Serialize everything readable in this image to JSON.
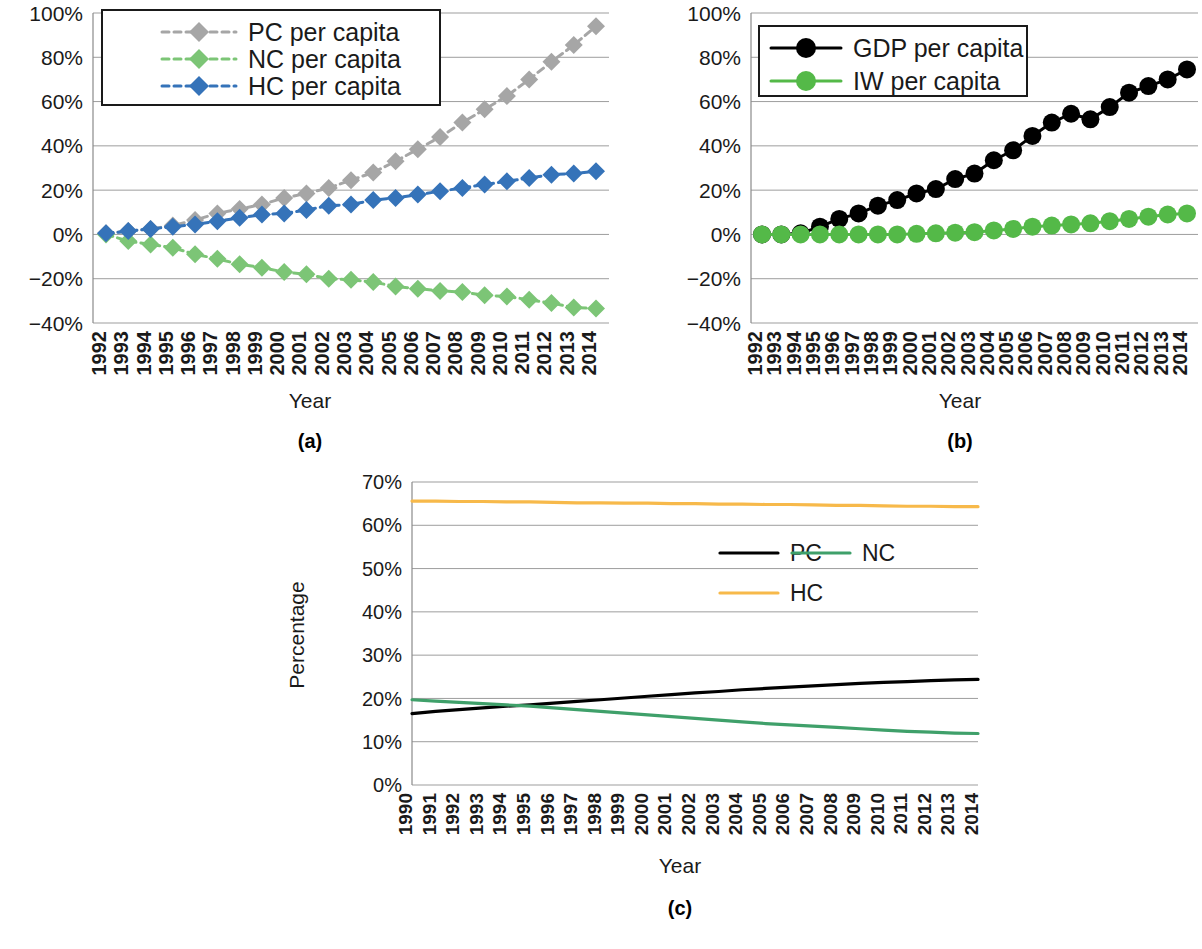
{
  "figure": {
    "panels": [
      {
        "id": "a",
        "caption": "(a)",
        "xlabel": "Year",
        "ylabel": "",
        "legend_border": true
      },
      {
        "id": "b",
        "caption": "(b)",
        "xlabel": "Year",
        "ylabel": "",
        "legend_border": true
      },
      {
        "id": "c",
        "caption": "(c)",
        "xlabel": "Year",
        "ylabel": "Percentage",
        "legend_border": false
      }
    ]
  },
  "colors": {
    "gray": "#a6a6a6",
    "green_light": "#7cc576",
    "blue": "#3573b9",
    "black": "#000000",
    "green_bright": "#54b948",
    "green_dark": "#3fa06a",
    "orange": "#f7b94a",
    "gridline": "#9d9d9d",
    "axis": "#8a8a8a"
  },
  "chart_data": [
    {
      "id": "a",
      "type": "line",
      "title": "",
      "xlabel": "Year",
      "ylabel": "",
      "grid": true,
      "legend_position": "top-left",
      "ylim": [
        -40,
        100
      ],
      "yticks": [
        -40,
        -20,
        0,
        20,
        40,
        60,
        80,
        100
      ],
      "ytick_labels": [
        "−40%",
        "−20%",
        "0%",
        "20%",
        "40%",
        "60%",
        "80%",
        "100%"
      ],
      "categories": [
        "1992",
        "1993",
        "1994",
        "1995",
        "1996",
        "1997",
        "1998",
        "1999",
        "2000",
        "2001",
        "2002",
        "2003",
        "2004",
        "2005",
        "2006",
        "2007",
        "2008",
        "2009",
        "2010",
        "2011",
        "2012",
        "2013",
        "2014"
      ],
      "series": [
        {
          "name": "PC per capita",
          "color": "#a6a6a6",
          "marker": "diamond",
          "dashed": true,
          "values": [
            0.5,
            1.5,
            2.5,
            4.0,
            6.5,
            9.5,
            11.5,
            13.5,
            16.5,
            18.5,
            21.0,
            24.5,
            28.0,
            33.0,
            38.5,
            44.0,
            50.5,
            56.5,
            62.5,
            70.0,
            78.0,
            85.5,
            94.0
          ]
        },
        {
          "name": "NC per capita",
          "color": "#7cc576",
          "marker": "diamond",
          "dashed": true,
          "values": [
            0.0,
            -3.0,
            -4.5,
            -6.0,
            -9.0,
            -11.0,
            -13.5,
            -15.0,
            -17.0,
            -18.0,
            -20.0,
            -20.5,
            -21.5,
            -23.5,
            -24.5,
            -25.5,
            -26.0,
            -27.5,
            -28.0,
            -29.5,
            -31.0,
            -33.0,
            -33.5
          ]
        },
        {
          "name": "HC per capita",
          "color": "#3573b9",
          "marker": "diamond",
          "dashed": true,
          "values": [
            0.5,
            1.5,
            2.5,
            3.5,
            4.5,
            6.0,
            7.5,
            9.0,
            9.5,
            11.0,
            13.0,
            13.5,
            15.5,
            16.5,
            18.0,
            19.5,
            21.0,
            22.5,
            24.0,
            25.5,
            27.0,
            27.5,
            28.5
          ]
        }
      ]
    },
    {
      "id": "b",
      "type": "line",
      "title": "",
      "xlabel": "Year",
      "ylabel": "",
      "grid": true,
      "legend_position": "top-left",
      "ylim": [
        -40,
        100
      ],
      "yticks": [
        -40,
        -20,
        0,
        20,
        40,
        60,
        80,
        100
      ],
      "ytick_labels": [
        "−40%",
        "−20%",
        "0%",
        "20%",
        "40%",
        "60%",
        "80%",
        "100%"
      ],
      "categories": [
        "1992",
        "1993",
        "1994",
        "1995",
        "1996",
        "1997",
        "1998",
        "1999",
        "2000",
        "2001",
        "2002",
        "2003",
        "2004",
        "2005",
        "2006",
        "2007",
        "2008",
        "2009",
        "2010",
        "2011",
        "2012",
        "2013",
        "2014"
      ],
      "series": [
        {
          "name": "GDP per capita",
          "color": "#000000",
          "marker": "circle",
          "dashed": false,
          "values": [
            0.0,
            0.0,
            0.5,
            3.5,
            7.0,
            9.5,
            13.0,
            15.5,
            18.5,
            20.5,
            25.0,
            27.5,
            33.5,
            38.0,
            44.5,
            50.5,
            54.5,
            52.0,
            57.5,
            64.0,
            67.0,
            70.0,
            74.5
          ]
        },
        {
          "name": "IW per capita",
          "color": "#54b948",
          "marker": "circle",
          "dashed": false,
          "values": [
            0.0,
            0.0,
            0.0,
            0.0,
            0.0,
            0.0,
            0.0,
            0.0,
            0.3,
            0.5,
            0.8,
            1.0,
            1.8,
            2.5,
            3.5,
            4.0,
            4.5,
            5.0,
            6.0,
            7.0,
            8.0,
            9.0,
            9.5
          ]
        }
      ]
    },
    {
      "id": "c",
      "type": "line",
      "title": "",
      "xlabel": "Year",
      "ylabel": "Percentage",
      "grid": true,
      "legend_position": "center-right",
      "ylim": [
        0,
        70
      ],
      "yticks": [
        0,
        10,
        20,
        30,
        40,
        50,
        60,
        70
      ],
      "ytick_labels": [
        "0%",
        "10%",
        "20%",
        "30%",
        "40%",
        "50%",
        "60%",
        "70%"
      ],
      "categories": [
        "1990",
        "1991",
        "1992",
        "1993",
        "1994",
        "1995",
        "1996",
        "1997",
        "1998",
        "1999",
        "2000",
        "2001",
        "2002",
        "2003",
        "2004",
        "2005",
        "2006",
        "2007",
        "2008",
        "2009",
        "2010",
        "2011",
        "2012",
        "2013",
        "2014"
      ],
      "series": [
        {
          "name": "PC",
          "color": "#000000",
          "marker": "none",
          "dashed": false,
          "values": [
            16.5,
            17.0,
            17.4,
            17.8,
            18.2,
            18.5,
            18.9,
            19.3,
            19.7,
            20.1,
            20.5,
            20.9,
            21.3,
            21.6,
            22.0,
            22.3,
            22.6,
            22.9,
            23.2,
            23.5,
            23.7,
            23.9,
            24.1,
            24.3,
            24.4
          ]
        },
        {
          "name": "NC",
          "color": "#3fa06a",
          "marker": "none",
          "dashed": false,
          "values": [
            19.7,
            19.4,
            19.1,
            18.8,
            18.5,
            18.2,
            17.8,
            17.4,
            17.0,
            16.6,
            16.2,
            15.8,
            15.4,
            15.0,
            14.6,
            14.2,
            13.9,
            13.6,
            13.3,
            13.0,
            12.7,
            12.4,
            12.2,
            12.0,
            11.9
          ]
        },
        {
          "name": "HC",
          "color": "#f7b94a",
          "marker": "none",
          "dashed": false,
          "values": [
            65.6,
            65.6,
            65.5,
            65.5,
            65.4,
            65.4,
            65.3,
            65.2,
            65.2,
            65.1,
            65.1,
            65.0,
            65.0,
            64.9,
            64.9,
            64.8,
            64.8,
            64.7,
            64.6,
            64.6,
            64.5,
            64.4,
            64.4,
            64.3,
            64.3
          ]
        }
      ]
    }
  ]
}
